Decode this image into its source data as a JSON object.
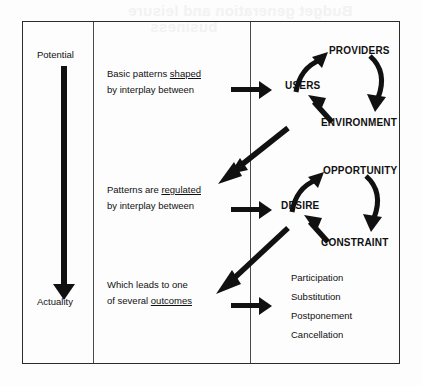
{
  "page": {
    "ghost_text_top": "Budget generation and leisure",
    "ghost_text_top2": "business"
  },
  "diagram": {
    "left_column": {
      "top_label": "Potential",
      "bottom_label": "Actuality",
      "arrow_icon": "down-arrow-icon"
    },
    "statements": [
      {
        "line1_pre": "Basic patterns ",
        "line1_underlined": "shaped",
        "line2": "by interplay between"
      },
      {
        "line1_pre": "Patterns are ",
        "line1_underlined": "regulated",
        "line2": "by interplay between"
      },
      {
        "line1_pre": "Which leads to one",
        "line1_underlined": "",
        "line2_pre": "of several ",
        "line2_underlined": "outcomes"
      }
    ],
    "cycles": [
      {
        "name": "shaping-cycle",
        "nodes": [
          "USERS",
          "PROVIDERS",
          "ENVIRONMENT"
        ]
      },
      {
        "name": "regulating-cycle",
        "nodes": [
          "DESIRE",
          "OPPORTUNITY",
          "CONSTRAINT"
        ]
      }
    ],
    "outcomes": [
      "Participation",
      "Substitution",
      "Postponement",
      "Cancellation"
    ],
    "colors": {
      "ink": "#111111",
      "frame": "#2b2b2b",
      "divider": "#4a4a4a",
      "paper": "#fdfdfd"
    }
  }
}
